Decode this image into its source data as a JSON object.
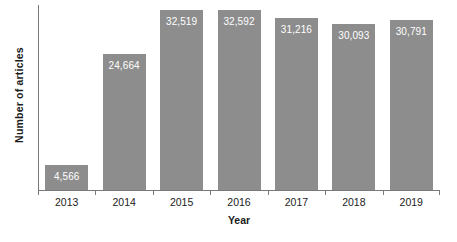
{
  "chart_data": {
    "type": "bar",
    "title": "",
    "xlabel": "Year",
    "ylabel": "Number of articles",
    "categories": [
      "2013",
      "2014",
      "2015",
      "2016",
      "2017",
      "2018",
      "2019"
    ],
    "values": [
      4566,
      24664,
      32519,
      32592,
      31216,
      30093,
      30791
    ],
    "value_labels": [
      "4,566",
      "24,664",
      "32,519",
      "32,592",
      "31,216",
      "30,093",
      "30,791"
    ],
    "ylim": [
      0,
      33500
    ],
    "grid": false,
    "legend": false,
    "bar_color": "#8d8d8d",
    "value_label_color": "#ffffff",
    "axis_color": "#7a7a7a",
    "background_color": "#ffffff"
  }
}
